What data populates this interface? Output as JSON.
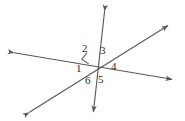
{
  "figure": {
    "kind": "geometry-diagram",
    "background_color": "#ffffff",
    "stroke_color": "#595959",
    "label_color": "#2b2b2b",
    "width": 185,
    "height": 121,
    "intersection": {
      "x": 97,
      "y": 67
    }
  },
  "lines": [
    {
      "name": "horizontal-line",
      "from": {
        "x": 10,
        "y": 52
      },
      "to": {
        "x": 176,
        "y": 80
      },
      "arrows": "both"
    },
    {
      "name": "vertical-line",
      "from": {
        "x": 105,
        "y": 7
      },
      "to": {
        "x": 93,
        "y": 116
      },
      "arrows": "both"
    },
    {
      "name": "diagonal-line",
      "from": {
        "x": 25,
        "y": 115
      },
      "to": {
        "x": 172,
        "y": 23
      },
      "arrows": "both"
    }
  ],
  "right_angle_marker": {
    "name": "right-angle-marker",
    "x": 86,
    "y": 57,
    "size": 8
  },
  "angle_labels": [
    {
      "id": "1",
      "text": "1",
      "x": 76,
      "y": 63
    },
    {
      "id": "2",
      "text": "2",
      "x": 82,
      "y": 43
    },
    {
      "id": "3",
      "text": "3",
      "x": 100,
      "y": 45
    },
    {
      "id": "4",
      "text": "4",
      "x": 111,
      "y": 61
    },
    {
      "id": "5",
      "text": "5",
      "x": 98,
      "y": 74
    },
    {
      "id": "6",
      "text": "6",
      "x": 85,
      "y": 75
    }
  ]
}
